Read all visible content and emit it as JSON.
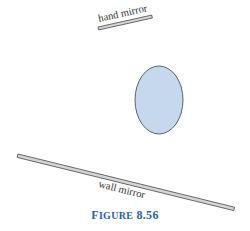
{
  "figure": {
    "caption_prefix_big": "F",
    "caption_prefix_small": "IGURE",
    "caption_number": "8.56",
    "caption_color": "#2f5fa8"
  },
  "labels": {
    "hand_mirror": "hand mirror",
    "wall_mirror": "wall mirror"
  },
  "shapes": {
    "object_fill": "#c6d8ee",
    "object_stroke": "#5a6272",
    "mirror_fill": "#d4d4d4",
    "mirror_stroke": "#555555"
  }
}
